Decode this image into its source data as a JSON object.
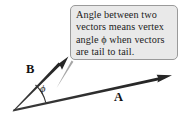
{
  "figure": {
    "background_color": "#ffffff"
  },
  "callout": {
    "border_color": "#9a9a9a",
    "fill_color": "#e9e9e9",
    "text_color": "#1c1c1c",
    "full_text": "Angle between two vectors means vertex angle ϕ when vectors are tail to tail.",
    "lines": [
      "Angle between two",
      "vectors means vertex",
      "angle ϕ when vectors",
      "are tail to tail."
    ]
  },
  "vectors": [
    {
      "name": "A",
      "label": "A",
      "color": "#2b2b2b",
      "tail": {
        "x": 13,
        "y": 111
      },
      "tip": {
        "x": 172,
        "y": 76
      }
    },
    {
      "name": "B",
      "label": "B",
      "color": "#2b2b2b",
      "tail": {
        "x": 13,
        "y": 111
      },
      "tip": {
        "x": 68,
        "y": 57
      }
    }
  ],
  "angle": {
    "symbol": "ϕ",
    "name": "phi",
    "description": "vertex angle between vectors A and B"
  },
  "leader_line": {
    "color": "#9e9e9e",
    "from": {
      "x": 71,
      "y": 61
    },
    "to": {
      "x": 56,
      "y": 88
    }
  }
}
